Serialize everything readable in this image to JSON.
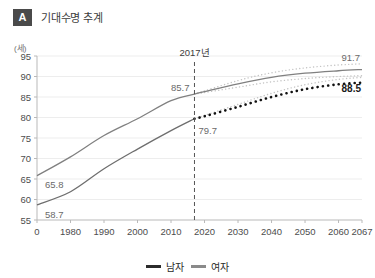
{
  "header": {
    "badge": "A",
    "title": "기대수명 추계"
  },
  "chart_data": {
    "type": "line",
    "title": "기대수명 추계",
    "xlabel": "",
    "ylabel": "(세)",
    "unit_label": "(세)",
    "xlim": [
      1970,
      2067
    ],
    "ylim": [
      55,
      95
    ],
    "yticks": [
      55,
      60,
      65,
      70,
      75,
      80,
      85,
      90,
      95
    ],
    "xticks": [
      "0",
      "1980",
      "1990",
      "2000",
      "2010",
      "2020",
      "2030",
      "2040",
      "2050",
      "2060",
      "2067"
    ],
    "xtick_values": [
      1970,
      1980,
      1990,
      2000,
      2010,
      2020,
      2030,
      2040,
      2050,
      2060,
      2067
    ],
    "grid": true,
    "legend_position": "bottom",
    "projection_start_year": 2017,
    "reference_line_label": "2017년",
    "series": [
      {
        "name": "여자",
        "color": "#808080",
        "style": "solid",
        "x": [
          1970,
          1980,
          1990,
          2000,
          2010,
          2017,
          2020,
          2030,
          2040,
          2050,
          2060,
          2067
        ],
        "values": [
          65.8,
          70.4,
          75.6,
          79.7,
          84.1,
          85.7,
          86.3,
          88.2,
          89.8,
          90.8,
          91.4,
          91.7
        ]
      },
      {
        "name": "남자",
        "color": "#1a1a1a",
        "style": "dotted-projection",
        "x": [
          1970,
          1980,
          1990,
          2000,
          2010,
          2017,
          2020,
          2030,
          2040,
          2050,
          2060,
          2067
        ],
        "values": [
          58.7,
          61.9,
          67.5,
          72.3,
          76.8,
          79.7,
          80.3,
          82.6,
          85.0,
          86.9,
          88.1,
          88.5
        ]
      }
    ],
    "confidence_bands": [
      {
        "name": "여자 상한",
        "x": [
          2017,
          2030,
          2040,
          2050,
          2060,
          2067
        ],
        "values": [
          85.7,
          89.0,
          90.9,
          92.1,
          92.8,
          93.1
        ]
      },
      {
        "name": "여자 하한",
        "x": [
          2017,
          2030,
          2040,
          2050,
          2060,
          2067
        ],
        "values": [
          85.7,
          87.4,
          88.7,
          89.5,
          90.0,
          90.2
        ]
      },
      {
        "name": "남자 상한",
        "x": [
          2017,
          2030,
          2040,
          2050,
          2060,
          2067
        ],
        "values": [
          79.7,
          83.2,
          85.9,
          88.0,
          89.3,
          89.8
        ]
      }
    ],
    "annotations": [
      {
        "name": "female-start",
        "label": "65.8",
        "x": 1970,
        "y": 65.8,
        "emphasis": "normal"
      },
      {
        "name": "male-start",
        "label": "58.7",
        "x": 1970,
        "y": 58.7,
        "emphasis": "normal"
      },
      {
        "name": "female-2017",
        "label": "85.7",
        "x": 2017,
        "y": 85.7,
        "emphasis": "normal"
      },
      {
        "name": "male-2017",
        "label": "79.7",
        "x": 2017,
        "y": 79.7,
        "emphasis": "normal"
      },
      {
        "name": "female-2067",
        "label": "91.7",
        "x": 2067,
        "y": 91.7,
        "emphasis": "normal"
      },
      {
        "name": "male-2067",
        "label": "88.5",
        "x": 2067,
        "y": 88.5,
        "emphasis": "bold"
      },
      {
        "name": "projection-year",
        "label": "2017년",
        "x": 2017,
        "y": 95,
        "emphasis": "normal"
      }
    ]
  },
  "legend": {
    "items": [
      {
        "label": "남자",
        "color": "#2b2b2b"
      },
      {
        "label": "여자",
        "color": "#8a8a8a"
      }
    ]
  }
}
